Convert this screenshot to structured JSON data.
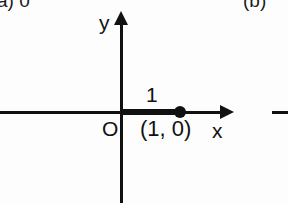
{
  "figure": {
    "part_a_label": "a) 0",
    "part_b_label": "(b)"
  },
  "axes": {
    "x_label": "x",
    "y_label": "y",
    "origin_label": "O"
  },
  "annotations": {
    "segment_length": "1",
    "point_coordinate": "(1, 0)"
  },
  "colors": {
    "ink": "#111111",
    "background": "#fdfdfd"
  },
  "chart_data": {
    "type": "scatter",
    "title": "",
    "xlabel": "x",
    "ylabel": "y",
    "points": [
      {
        "x": 1,
        "y": 0,
        "label": "(1, 0)",
        "marker": "filled-circle"
      }
    ],
    "segments": [
      {
        "from": [
          0,
          0
        ],
        "to": [
          1,
          0
        ],
        "label": "1",
        "style": "thick"
      }
    ],
    "origin_label": "O",
    "xlim": [
      -2.1,
      1.9
    ],
    "ylim": [
      -1.55,
      1.6
    ],
    "grid": false,
    "legend": false,
    "axis_arrows": {
      "x": "positive",
      "y": "positive"
    }
  }
}
